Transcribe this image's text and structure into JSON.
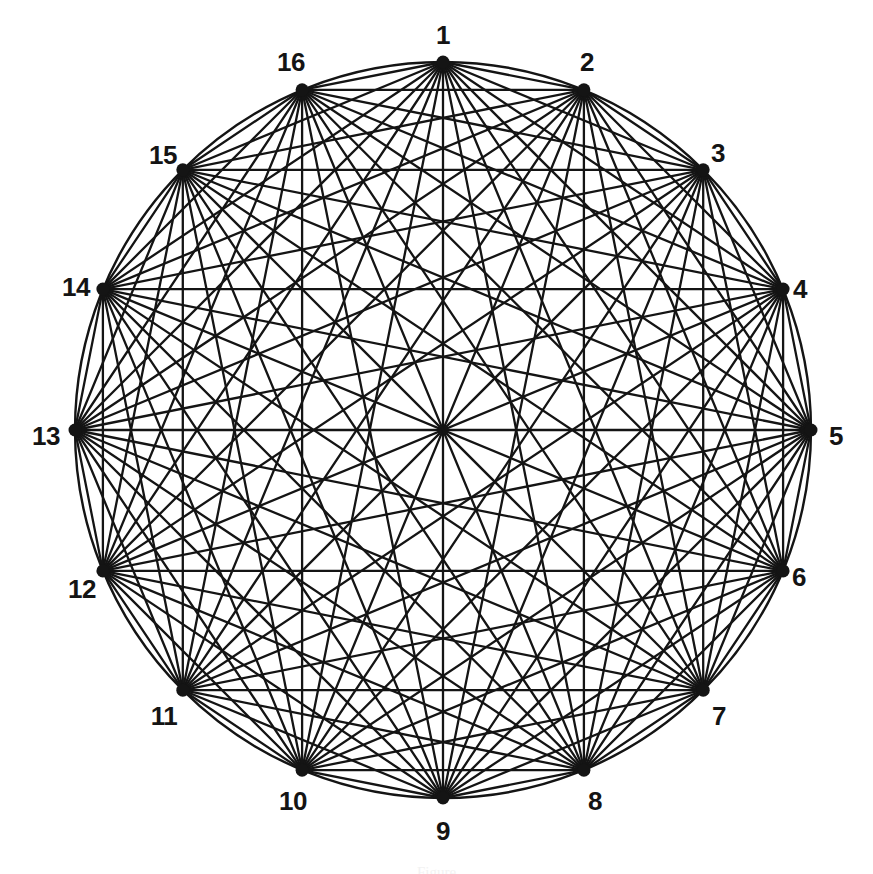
{
  "figure": {
    "kind": "complete-graph-diagram",
    "caption_partial": "Figure",
    "background_color": "#ffffff",
    "ink_color": "#141414",
    "canvas": {
      "width": 873,
      "height": 874
    }
  },
  "chart_data": {
    "type": "graph",
    "title": "",
    "graph_name": "K16",
    "vertex_count": 16,
    "edge_count": 120,
    "complete": true,
    "layout": "circular",
    "circle": {
      "center_x": 443,
      "center_y": 430,
      "radius": 368,
      "stroke_width": 2.4,
      "visible": true
    },
    "vertex_style": {
      "radius": 6.5,
      "fill": "#141414"
    },
    "edge_style": {
      "stroke": "#141414",
      "stroke_width": 2.3
    },
    "label_style": {
      "font_size": 26,
      "font_weight": "bold",
      "color": "#141414",
      "offset": 40
    },
    "vertices": [
      {
        "id": 1,
        "label": "1",
        "angle_deg": 270,
        "x": 443.0,
        "y": 62.0,
        "label_x": 443,
        "label_y": 35
      },
      {
        "id": 2,
        "label": "2",
        "angle_deg": 292.5,
        "x": 583.9,
        "y": 89.8,
        "label_x": 587,
        "label_y": 62
      },
      {
        "id": 3,
        "label": "3",
        "angle_deg": 315,
        "x": 703.2,
        "y": 169.8,
        "label_x": 718,
        "label_y": 153
      },
      {
        "id": 4,
        "label": "4",
        "angle_deg": 337.5,
        "x": 783.1,
        "y": 289.1,
        "label_x": 800,
        "label_y": 289
      },
      {
        "id": 5,
        "label": "5",
        "angle_deg": 0,
        "x": 811.0,
        "y": 430.0,
        "label_x": 836,
        "label_y": 436
      },
      {
        "id": 6,
        "label": "6",
        "angle_deg": 22.5,
        "x": 783.1,
        "y": 570.9,
        "label_x": 799,
        "label_y": 577
      },
      {
        "id": 7,
        "label": "7",
        "angle_deg": 45,
        "x": 703.2,
        "y": 690.2,
        "label_x": 719,
        "label_y": 716
      },
      {
        "id": 8,
        "label": "8",
        "angle_deg": 67.5,
        "x": 583.9,
        "y": 770.2,
        "label_x": 595,
        "label_y": 801
      },
      {
        "id": 9,
        "label": "9",
        "angle_deg": 90,
        "x": 443.0,
        "y": 798.0,
        "label_x": 443,
        "label_y": 831
      },
      {
        "id": 10,
        "label": "10",
        "angle_deg": 112.5,
        "x": 302.1,
        "y": 770.2,
        "label_x": 293,
        "label_y": 801
      },
      {
        "id": 11,
        "label": "11",
        "angle_deg": 135,
        "x": 182.8,
        "y": 690.2,
        "label_x": 164,
        "label_y": 716
      },
      {
        "id": 12,
        "label": "12",
        "angle_deg": 157.5,
        "x": 102.9,
        "y": 570.9,
        "label_x": 82,
        "label_y": 589
      },
      {
        "id": 13,
        "label": "13",
        "angle_deg": 180,
        "x": 75.0,
        "y": 430.0,
        "label_x": 46,
        "label_y": 436
      },
      {
        "id": 14,
        "label": "14",
        "angle_deg": 202.5,
        "x": 102.9,
        "y": 289.1,
        "label_x": 76,
        "label_y": 287
      },
      {
        "id": 15,
        "label": "15",
        "angle_deg": 225,
        "x": 182.8,
        "y": 169.8,
        "label_x": 163,
        "label_y": 155
      },
      {
        "id": 16,
        "label": "16",
        "angle_deg": 247.5,
        "x": 302.1,
        "y": 89.8,
        "label_x": 291,
        "label_y": 62
      }
    ]
  }
}
